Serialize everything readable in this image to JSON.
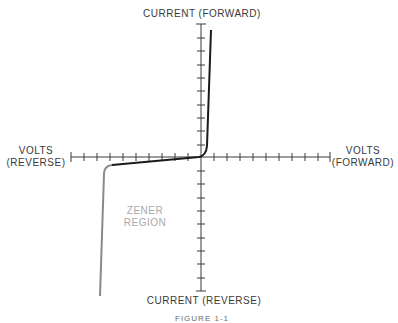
{
  "diagram": {
    "title_top": "CURRENT (FORWARD)",
    "title_bottom": "CURRENT (REVERSE)",
    "left_label": [
      "VOLTS",
      "(REVERSE)"
    ],
    "right_label": [
      "VOLTS",
      "(FORWARD)"
    ],
    "region_label": [
      "ZENER",
      "REGION"
    ],
    "caption": "FIGURE 1-1",
    "colors": {
      "axis": "#3a3a3a",
      "forward_curve": "#1a1a1a",
      "zener_curve": "#8a8a8a",
      "region_text": "#a8a8a8"
    },
    "axes": {
      "horizontal_ticks_left": 10,
      "horizontal_ticks_right": 10,
      "vertical_ticks_up": 10,
      "vertical_ticks_down": 10
    }
  }
}
